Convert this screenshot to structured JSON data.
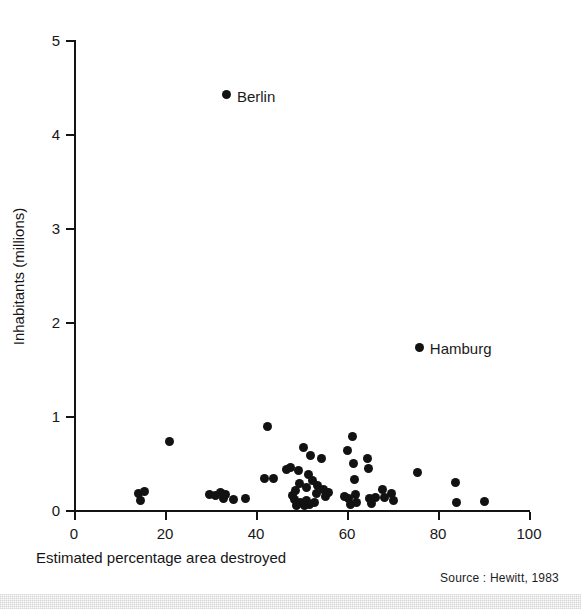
{
  "chart_data": {
    "type": "scatter",
    "title": "",
    "xlabel": "Estimated percentage area destroyed",
    "ylabel": "Inhabitants (millions)",
    "xlim": [
      0,
      100
    ],
    "ylim": [
      0,
      5
    ],
    "xticks": [
      0,
      20,
      40,
      60,
      80,
      100
    ],
    "yticks": [
      0,
      1,
      2,
      3,
      4,
      5
    ],
    "xtick_labels": [
      "0",
      "20",
      "40",
      "60",
      "80",
      "100"
    ],
    "ytick_labels": [
      "0",
      "1",
      "2",
      "3",
      "4",
      "5"
    ],
    "grid": false,
    "legend": "none",
    "source_note": "Source : Hewitt, 1983",
    "marker_color": "#121212",
    "axis_color": "#141414",
    "background_color": "#ffffff",
    "annotations": [
      {
        "label": "Berlin",
        "x": 33.6,
        "y": 4.42,
        "dx": 10,
        "dy": -6
      },
      {
        "label": "Hamburg",
        "x": 76.0,
        "y": 1.73,
        "dx": 10,
        "dy": -6
      }
    ],
    "points": [
      {
        "x": 33.6,
        "y": 4.42,
        "label": "Berlin"
      },
      {
        "x": 76.0,
        "y": 1.73,
        "label": "Hamburg"
      },
      {
        "x": 14.2,
        "y": 0.18,
        "label": ""
      },
      {
        "x": 14.6,
        "y": 0.1,
        "label": ""
      },
      {
        "x": 15.4,
        "y": 0.2,
        "label": ""
      },
      {
        "x": 21.0,
        "y": 0.73,
        "label": ""
      },
      {
        "x": 29.8,
        "y": 0.17,
        "label": ""
      },
      {
        "x": 31.0,
        "y": 0.15,
        "label": ""
      },
      {
        "x": 32.2,
        "y": 0.19,
        "label": ""
      },
      {
        "x": 32.8,
        "y": 0.12,
        "label": ""
      },
      {
        "x": 33.4,
        "y": 0.16,
        "label": ""
      },
      {
        "x": 35.0,
        "y": 0.11,
        "label": ""
      },
      {
        "x": 37.6,
        "y": 0.12,
        "label": ""
      },
      {
        "x": 42.6,
        "y": 0.89,
        "label": ""
      },
      {
        "x": 41.8,
        "y": 0.33,
        "label": ""
      },
      {
        "x": 43.8,
        "y": 0.33,
        "label": ""
      },
      {
        "x": 46.6,
        "y": 0.43,
        "label": ""
      },
      {
        "x": 47.6,
        "y": 0.45,
        "label": ""
      },
      {
        "x": 48.0,
        "y": 0.15,
        "label": ""
      },
      {
        "x": 48.4,
        "y": 0.11,
        "label": ""
      },
      {
        "x": 48.6,
        "y": 0.21,
        "label": ""
      },
      {
        "x": 49.0,
        "y": 0.05,
        "label": ""
      },
      {
        "x": 49.4,
        "y": 0.42,
        "label": ""
      },
      {
        "x": 49.6,
        "y": 0.28,
        "label": ""
      },
      {
        "x": 49.8,
        "y": 0.08,
        "label": ""
      },
      {
        "x": 50.4,
        "y": 0.67,
        "label": ""
      },
      {
        "x": 50.6,
        "y": 0.05,
        "label": ""
      },
      {
        "x": 51.0,
        "y": 0.24,
        "label": ""
      },
      {
        "x": 51.2,
        "y": 0.1,
        "label": ""
      },
      {
        "x": 51.6,
        "y": 0.38,
        "label": ""
      },
      {
        "x": 51.8,
        "y": 0.06,
        "label": ""
      },
      {
        "x": 52.0,
        "y": 0.58,
        "label": ""
      },
      {
        "x": 52.4,
        "y": 0.31,
        "label": ""
      },
      {
        "x": 52.8,
        "y": 0.08,
        "label": ""
      },
      {
        "x": 53.2,
        "y": 0.18,
        "label": ""
      },
      {
        "x": 53.6,
        "y": 0.26,
        "label": ""
      },
      {
        "x": 54.4,
        "y": 0.55,
        "label": ""
      },
      {
        "x": 54.8,
        "y": 0.22,
        "label": ""
      },
      {
        "x": 55.2,
        "y": 0.14,
        "label": ""
      },
      {
        "x": 56.0,
        "y": 0.19,
        "label": ""
      },
      {
        "x": 59.4,
        "y": 0.14,
        "label": ""
      },
      {
        "x": 60.2,
        "y": 0.63,
        "label": ""
      },
      {
        "x": 60.4,
        "y": 0.12,
        "label": ""
      },
      {
        "x": 60.8,
        "y": 0.06,
        "label": ""
      },
      {
        "x": 61.2,
        "y": 0.78,
        "label": ""
      },
      {
        "x": 61.4,
        "y": 0.5,
        "label": ""
      },
      {
        "x": 61.6,
        "y": 0.32,
        "label": ""
      },
      {
        "x": 61.8,
        "y": 0.16,
        "label": ""
      },
      {
        "x": 62.0,
        "y": 0.08,
        "label": ""
      },
      {
        "x": 64.6,
        "y": 0.55,
        "label": ""
      },
      {
        "x": 64.8,
        "y": 0.44,
        "label": ""
      },
      {
        "x": 65.0,
        "y": 0.12,
        "label": ""
      },
      {
        "x": 65.4,
        "y": 0.07,
        "label": ""
      },
      {
        "x": 66.2,
        "y": 0.13,
        "label": ""
      },
      {
        "x": 67.8,
        "y": 0.22,
        "label": ""
      },
      {
        "x": 68.2,
        "y": 0.13,
        "label": ""
      },
      {
        "x": 69.8,
        "y": 0.18,
        "label": ""
      },
      {
        "x": 70.2,
        "y": 0.1,
        "label": ""
      },
      {
        "x": 75.6,
        "y": 0.4,
        "label": ""
      },
      {
        "x": 83.8,
        "y": 0.29,
        "label": ""
      },
      {
        "x": 84.0,
        "y": 0.08,
        "label": ""
      },
      {
        "x": 90.2,
        "y": 0.09,
        "label": ""
      }
    ]
  },
  "figure": {
    "x_axis_title": "Estimated percentage area destroyed",
    "y_axis_title": "Inhabitants (millions)",
    "source": "Source : Hewitt, 1983"
  }
}
